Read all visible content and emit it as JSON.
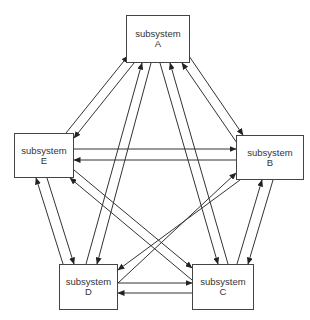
{
  "diagram": {
    "type": "fully-connected subsystem graph",
    "nodes": [
      {
        "id": "A",
        "label": "subsystem",
        "letter": "A"
      },
      {
        "id": "B",
        "label": "subsystem",
        "letter": "B"
      },
      {
        "id": "C",
        "label": "subsystem",
        "letter": "C"
      },
      {
        "id": "D",
        "label": "subsystem",
        "letter": "D"
      },
      {
        "id": "E",
        "label": "subsystem",
        "letter": "E"
      }
    ],
    "edges": [
      {
        "from": "A",
        "to": "B"
      },
      {
        "from": "B",
        "to": "A"
      },
      {
        "from": "A",
        "to": "C"
      },
      {
        "from": "C",
        "to": "A"
      },
      {
        "from": "A",
        "to": "D"
      },
      {
        "from": "D",
        "to": "A"
      },
      {
        "from": "A",
        "to": "E"
      },
      {
        "from": "E",
        "to": "A"
      },
      {
        "from": "B",
        "to": "C"
      },
      {
        "from": "C",
        "to": "B"
      },
      {
        "from": "B",
        "to": "D"
      },
      {
        "from": "D",
        "to": "B"
      },
      {
        "from": "B",
        "to": "E"
      },
      {
        "from": "E",
        "to": "B"
      },
      {
        "from": "C",
        "to": "D"
      },
      {
        "from": "D",
        "to": "C"
      },
      {
        "from": "C",
        "to": "E"
      },
      {
        "from": "E",
        "to": "C"
      },
      {
        "from": "D",
        "to": "E"
      },
      {
        "from": "E",
        "to": "D"
      }
    ],
    "line_color": "#333333"
  }
}
